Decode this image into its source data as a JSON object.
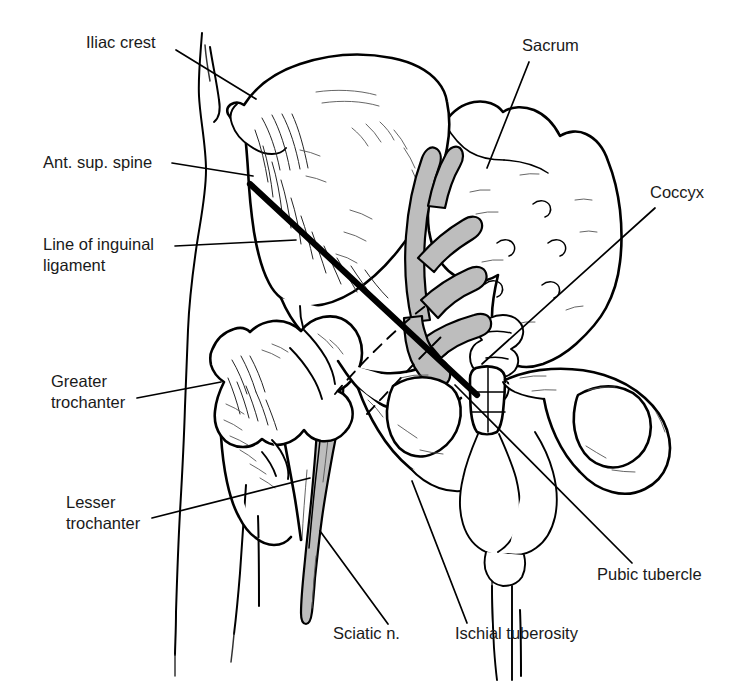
{
  "figure": {
    "width": 743,
    "height": 700,
    "background_color": "#ffffff",
    "line_color": "#000000",
    "nerve_fill_color": "#bdbdbd"
  },
  "labels": [
    {
      "id": "iliac-crest",
      "text": "Iliac crest",
      "lines": [
        "Iliac crest"
      ],
      "text_x": 86,
      "text_y": 48,
      "anchor": "start",
      "leader": "M 176 50 L 256 99"
    },
    {
      "id": "ant-sup-spine",
      "text": "Ant. sup. spine",
      "lines": [
        "Ant. sup. spine"
      ],
      "text_x": 43,
      "text_y": 168,
      "anchor": "start",
      "leader": "M 172 163 L 253 176"
    },
    {
      "id": "line-of-inguinal-ligament",
      "text": "Line of inguinal ligament",
      "lines": [
        "Line of inguinal",
        "ligament"
      ],
      "text_x": 43,
      "text_y": 250,
      "anchor": "start",
      "leader": "M 175 246 L 296 240"
    },
    {
      "id": "greater-trochanter",
      "text": "Greater trochanter",
      "lines": [
        "Greater",
        "trochanter"
      ],
      "text_x": 51,
      "text_y": 387,
      "anchor": "start",
      "leader": "M 137 398 L 221 382"
    },
    {
      "id": "lesser-trochanter",
      "text": "Lesser trochanter",
      "lines": [
        "Lesser",
        "trochanter"
      ],
      "text_x": 66,
      "text_y": 508,
      "anchor": "start",
      "leader": "M 152 518 L 310 478"
    },
    {
      "id": "sciatic-nerve",
      "text": "Sciatic n.",
      "lines": [
        "Sciatic n."
      ],
      "text_x": 333,
      "text_y": 639,
      "anchor": "start",
      "leader": "M 388 624 L 320 531"
    },
    {
      "id": "ischial-tuberosity",
      "text": "Ischial tuberosity",
      "lines": [
        "Ischial tuberosity"
      ],
      "text_x": 455,
      "text_y": 639,
      "anchor": "start",
      "leader": "M 467 623 L 412 481"
    },
    {
      "id": "pubic-tubercle",
      "text": "Pubic tubercle",
      "lines": [
        "Pubic tubercle"
      ],
      "text_x": 597,
      "text_y": 580,
      "anchor": "start",
      "leader": "M 632 563 L 455 385"
    },
    {
      "id": "sacrum",
      "text": "Sacrum",
      "lines": [
        "Sacrum"
      ],
      "text_x": 522,
      "text_y": 51,
      "anchor": "start",
      "leader": "M 529 62 L 487 168"
    },
    {
      "id": "coccyx",
      "text": "Coccyx",
      "lines": [
        "Coccyx"
      ],
      "text_x": 650,
      "text_y": 198,
      "anchor": "start",
      "leader": "M 655 208 L 482 364"
    }
  ],
  "structures": {
    "ilium": "iliac wing (left hip bone)",
    "sacrum": "sacrum with anterior sacral foramina",
    "coccyx": "coccyx",
    "femur": "proximal femur with greater and lesser trochanter",
    "pubic_symphysis": "pubic symphysis",
    "obturator_foramen": "obturator foramina (left and right)",
    "sciatic_nerve": "sciatic nerve and sacral nerve roots (shaded gray)",
    "inguinal_ligament": "line of inguinal ligament (heavy black line)",
    "dashed_marker": "dashed reference line"
  }
}
